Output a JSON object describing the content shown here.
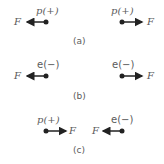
{
  "panels": [
    {
      "caption": "(a)",
      "left": {
        "charge": "p(+)",
        "force": "F",
        "direction": "left"
      },
      "right": {
        "charge": "p(+)",
        "force": "F",
        "direction": "right"
      }
    },
    {
      "caption": "(b)",
      "left": {
        "charge": "e(−)",
        "force": "F",
        "direction": "left"
      },
      "right": {
        "charge": "e(−)",
        "force": "F",
        "direction": "right"
      }
    },
    {
      "caption": "(c)",
      "left": {
        "charge": "p(+)",
        "force": "F",
        "direction": "right"
      },
      "right": {
        "charge": "e(−)",
        "force": "F",
        "direction": "left"
      }
    }
  ],
  "colors": {
    "ink": "#222222",
    "text": "#5a5a5a"
  }
}
